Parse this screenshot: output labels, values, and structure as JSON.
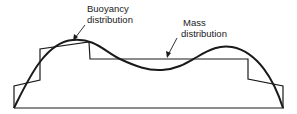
{
  "diagram": {
    "labels": {
      "buoyancy_line1": "Buoyancy",
      "buoyancy_line2": "distribution",
      "mass_line1": "Mass",
      "mass_line2": "distribution"
    },
    "colors": {
      "line": "#1a1a1a",
      "background": "#ffffff"
    }
  }
}
